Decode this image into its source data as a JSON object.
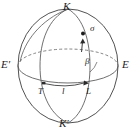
{
  "figure": {
    "type": "sphere-geometry-diagram",
    "colors": {
      "stroke": "#4a4a4a",
      "outline": "#3d3d3d",
      "label": "#1d1d1d",
      "background": "#ffffff"
    },
    "geometry": {
      "center_x": 68,
      "center_y": 66,
      "radius_x": 50,
      "radius_y": 57,
      "equator_ry": 17,
      "pole_top_y": 9,
      "pole_bottom_y": 123
    }
  },
  "labels": {
    "north_pole": "K",
    "south_pole": "K′",
    "equator_left": "E′",
    "equator_right": "E",
    "meridian_foot_left": "T",
    "meridian_foot_right": "L",
    "arc_length": "l",
    "angle_beta": "β",
    "arc_sigma": "σ"
  },
  "label_positions": {
    "north_pole": {
      "x": 63,
      "y": 1
    },
    "south_pole": {
      "x": 60,
      "y": 119
    },
    "equator_left": {
      "x": 2,
      "y": 60
    },
    "equator_right": {
      "x": 123,
      "y": 60
    },
    "meridian_foot_left": {
      "x": 39,
      "y": 88
    },
    "meridian_foot_right": {
      "x": 87,
      "y": 88
    },
    "arc_length": {
      "x": 62,
      "y": 88
    },
    "angle_beta": {
      "x": 85,
      "y": 58
    },
    "arc_sigma": {
      "x": 90,
      "y": 25
    }
  },
  "markers": {
    "sigma_point": {
      "x": 83,
      "y": 34
    },
    "arrow_sigma": {
      "x": 82,
      "y": 44
    },
    "point_T": {
      "x": 43,
      "y": 84
    },
    "point_L": {
      "x": 85,
      "y": 83
    }
  }
}
